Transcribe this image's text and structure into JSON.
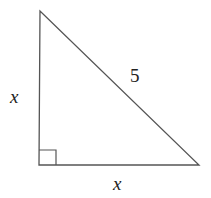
{
  "diagram": {
    "type": "right-triangle",
    "labels": {
      "left_leg": "x",
      "bottom_leg": "x",
      "hypotenuse": "5"
    },
    "right_angle_marker": true,
    "stroke_color": "#555555"
  }
}
